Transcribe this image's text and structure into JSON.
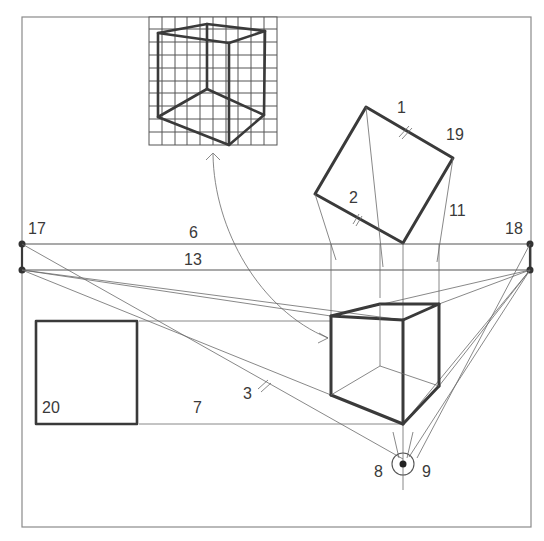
{
  "diagram": {
    "labels": [
      {
        "id": "1",
        "text": "1",
        "x": 397,
        "y": 108
      },
      {
        "id": "19",
        "text": "19",
        "x": 447,
        "y": 126
      },
      {
        "id": "2",
        "text": "2",
        "x": 347,
        "y": 190
      },
      {
        "id": "11",
        "text": "11",
        "x": 449,
        "y": 203
      },
      {
        "id": "17",
        "text": "17",
        "x": 28,
        "y": 223
      },
      {
        "id": "6",
        "text": "6",
        "x": 189,
        "y": 226
      },
      {
        "id": "18",
        "text": "18",
        "x": 505,
        "y": 223
      },
      {
        "id": "13",
        "text": "13",
        "x": 183,
        "y": 252
      },
      {
        "id": "3",
        "text": "3",
        "x": 243,
        "y": 388
      },
      {
        "id": "20",
        "text": "20",
        "x": 42,
        "y": 403
      },
      {
        "id": "7",
        "text": "7",
        "x": 192,
        "y": 403
      },
      {
        "id": "8",
        "text": "8",
        "x": 374,
        "y": 464
      },
      {
        "id": "9",
        "text": "9",
        "x": 422,
        "y": 464
      }
    ],
    "colors": {
      "line": "#6a6a6a",
      "heavy": "#3a3a3a",
      "frame": "#8a8a8a",
      "background": "#ffffff"
    }
  }
}
